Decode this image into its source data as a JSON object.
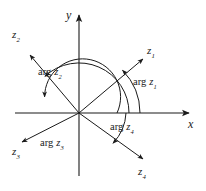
{
  "figure": {
    "type": "complex-plane-argument-diagram",
    "background_color": "#ffffff",
    "stroke_color": "#1a1a1a",
    "text_color": "#1a1a1a",
    "origin": {
      "x": 79,
      "y": 113
    },
    "axes": {
      "x": {
        "label": "x",
        "label_pos": {
          "x": 188,
          "y": 119
        },
        "start": {
          "x": 15,
          "y": 113
        },
        "end": {
          "x": 191,
          "y": 113
        }
      },
      "y": {
        "label": "y",
        "label_pos": {
          "x": 66,
          "y": 11
        },
        "start": {
          "x": 79,
          "y": 176
        },
        "end": {
          "x": 79,
          "y": 13
        }
      }
    },
    "vectors": [
      {
        "name": "z1",
        "label": "z",
        "subscript": "1",
        "label_pos": {
          "x": 148,
          "y": 48
        },
        "tip": {
          "x": 144,
          "y": 58
        },
        "angle_deg": 45
      },
      {
        "name": "z2",
        "label": "z",
        "subscript": "2",
        "label_pos": {
          "x": 13,
          "y": 32
        },
        "tip": {
          "x": 29,
          "y": 54
        },
        "angle_deg": 133
      },
      {
        "name": "z3",
        "label": "z",
        "subscript": "3",
        "label_pos": {
          "x": 14,
          "y": 148
        },
        "tip": {
          "x": 21,
          "y": 142
        },
        "angle_deg": 205
      },
      {
        "name": "z4",
        "label": "z",
        "subscript": "4",
        "label_pos": {
          "x": 139,
          "y": 168
        },
        "tip": {
          "x": 144,
          "y": 160
        },
        "angle_deg": -40
      }
    ],
    "arguments": [
      {
        "name": "arg-z1",
        "text": "arg",
        "variable": "z",
        "subscript": "1",
        "label_pos": {
          "x": 136,
          "y": 82
        },
        "arc_radius": 61,
        "arc_from_deg": 0,
        "arc_to_deg": 45
      },
      {
        "name": "arg-z2",
        "text": "arg",
        "variable": "z",
        "subscript": "2",
        "label_pos": {
          "x": 41,
          "y": 72
        },
        "arc_radius": 50,
        "arc_from_deg": 0,
        "arc_to_deg": 133
      },
      {
        "name": "arg-z3",
        "text": "arg",
        "variable": "z",
        "subscript": "3",
        "label_pos": {
          "x": 43,
          "y": 143
        },
        "arc_radius": 38,
        "arc_from_deg": 0,
        "arc_to_deg": 205
      },
      {
        "name": "arg-z4",
        "text": "arg",
        "variable": "z",
        "subscript": "4",
        "label_pos": {
          "x": 113,
          "y": 127
        },
        "arc_radius": 47,
        "arc_from_deg": 0,
        "arc_to_deg": -40
      }
    ]
  }
}
